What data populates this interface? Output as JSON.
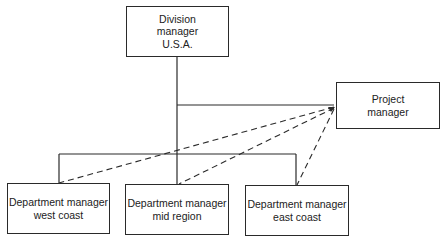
{
  "diagram": {
    "type": "organization-chart",
    "nodes": {
      "division": {
        "lines": [
          "Division",
          "manager",
          "U.S.A."
        ]
      },
      "project": {
        "lines": [
          "Project",
          "manager"
        ]
      },
      "west": {
        "lines": [
          "Department manager",
          "west coast"
        ]
      },
      "mid": {
        "lines": [
          "Department manager",
          "mid region"
        ]
      },
      "east": {
        "lines": [
          "Department manager",
          "east coast"
        ]
      }
    },
    "edges": [
      {
        "from": "Division manager U.S.A.",
        "to": "Project manager",
        "style": "solid"
      },
      {
        "from": "Division manager U.S.A.",
        "to": "Department manager west coast",
        "style": "solid"
      },
      {
        "from": "Division manager U.S.A.",
        "to": "Department manager mid region",
        "style": "solid"
      },
      {
        "from": "Division manager U.S.A.",
        "to": "Department manager east coast",
        "style": "solid"
      },
      {
        "from": "Project manager",
        "to": "Department manager west coast",
        "style": "dashed"
      },
      {
        "from": "Project manager",
        "to": "Department manager mid region",
        "style": "dashed"
      },
      {
        "from": "Project manager",
        "to": "Department manager east coast",
        "style": "dashed"
      }
    ],
    "colors": {
      "line": "#2a2a2a",
      "background": "#ffffff"
    }
  }
}
